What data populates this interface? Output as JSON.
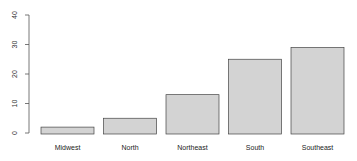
{
  "chart_data": {
    "type": "bar",
    "title": "",
    "xlabel": "",
    "ylabel": "",
    "categories": [
      "Midwest",
      "North",
      "Northeast",
      "South",
      "Southeast"
    ],
    "values": [
      2,
      5,
      13,
      25,
      29
    ],
    "ylim": [
      0,
      40
    ],
    "yticks": [
      0,
      10,
      20,
      30,
      40
    ],
    "grid": false,
    "legend": null,
    "bar_color": "#d3d3d3",
    "bar_edge_color": "#444444"
  }
}
